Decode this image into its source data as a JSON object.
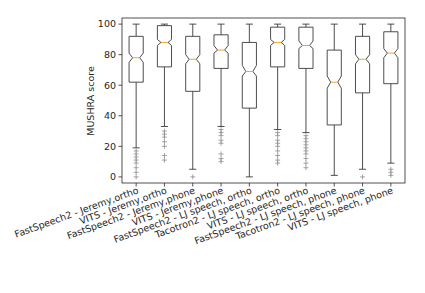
{
  "chart_data": {
    "type": "box",
    "notched": true,
    "title": "",
    "xlabel": "",
    "ylabel": "MUSHRA score",
    "ylim": [
      -4,
      104
    ],
    "yticks": [
      0,
      20,
      40,
      60,
      80,
      100
    ],
    "grid": false,
    "legend": "none",
    "categories": [
      "FastSpeech2 - Jeremy,ortho",
      "VITS - Jeremy,ortho",
      "FastSpeech2 - Jeremy,phone",
      "VITS - Jeremy,phone",
      "FastSpeech2 - LJ speech, ortho",
      "Tacotron2 - LJ speech, ortho",
      "VITS - LJ speech, ortho",
      "FastSpeech2 - LJ speech, phone",
      "Tacotron2 - LJ speech, phone",
      "VITS - LJ speech, phone"
    ],
    "boxes": [
      {
        "whisker_low": 19,
        "q1": 62,
        "median": 78,
        "q3": 92,
        "whisker_high": 100,
        "notch": [
          75,
          81
        ],
        "outliers": [
          17,
          15,
          13,
          11,
          9,
          6,
          3,
          0
        ]
      },
      {
        "whisker_low": 33,
        "q1": 72,
        "median": 88,
        "q3": 99,
        "whisker_high": 100,
        "notch": [
          86,
          90
        ],
        "outliers": [
          30,
          28,
          26,
          23,
          20,
          14,
          11
        ]
      },
      {
        "whisker_low": 5,
        "q1": 56,
        "median": 77,
        "q3": 92,
        "whisker_high": 100,
        "notch": [
          74,
          80
        ],
        "outliers": [
          0
        ]
      },
      {
        "whisker_low": 33,
        "q1": 71,
        "median": 83,
        "q3": 93,
        "whisker_high": 100,
        "notch": [
          81,
          86
        ],
        "outliers": [
          31,
          29,
          27,
          24,
          22,
          15,
          12,
          10
        ]
      },
      {
        "whisker_low": 0,
        "q1": 45,
        "median": 69,
        "q3": 88,
        "whisker_high": 100,
        "notch": [
          66,
          73
        ],
        "outliers": []
      },
      {
        "whisker_low": 31,
        "q1": 72,
        "median": 88,
        "q3": 98,
        "whisker_high": 100,
        "notch": [
          86,
          90
        ],
        "outliers": [
          29,
          27,
          24,
          22,
          20,
          17,
          14,
          11,
          9
        ]
      },
      {
        "whisker_low": 29,
        "q1": 71,
        "median": 86,
        "q3": 98,
        "whisker_high": 100,
        "notch": [
          84,
          89
        ],
        "outliers": [
          27,
          25,
          23,
          21,
          19,
          17,
          15,
          12,
          9,
          6
        ]
      },
      {
        "whisker_low": 1,
        "q1": 34,
        "median": 62,
        "q3": 83,
        "whisker_high": 100,
        "notch": [
          58,
          66
        ],
        "outliers": []
      },
      {
        "whisker_low": 5,
        "q1": 55,
        "median": 77,
        "q3": 92,
        "whisker_high": 100,
        "notch": [
          74,
          80
        ],
        "outliers": [
          0
        ]
      },
      {
        "whisker_low": 9,
        "q1": 61,
        "median": 81,
        "q3": 95,
        "whisker_high": 100,
        "notch": [
          78,
          84
        ],
        "outliers": [
          5,
          3,
          1
        ]
      }
    ],
    "colors": {
      "box": "#3a3a3a",
      "median": "#f39c12",
      "outlier": "#7f7f7f",
      "axis": "#262626"
    }
  }
}
